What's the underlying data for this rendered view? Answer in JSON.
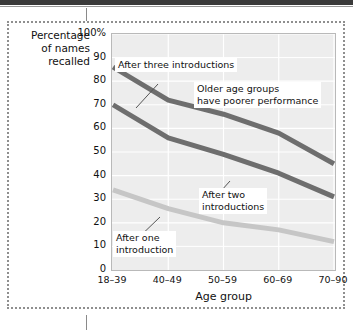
{
  "figure": {
    "y_axis_title": "Percentage\nof names\nrecalled",
    "x_axis_title": "Age group"
  },
  "annotations": {
    "three": "After three introductions",
    "older": "Older age groups\nhave poorer performance",
    "two": "After two\nintroductions",
    "one": "After one\nintroduction"
  },
  "colors": {
    "dark_line": "#6e6e6e",
    "light_line": "#c6c6c6",
    "plot_background": "#ededed",
    "gridline": "#ffffff",
    "frame": "#8f8f8f",
    "text": "#111111"
  },
  "chart_data": {
    "type": "line",
    "title": "",
    "xlabel": "Age group",
    "ylabel": "Percentage of names recalled",
    "categories": [
      "18–39",
      "40–49",
      "50–59",
      "60–69",
      "70–90"
    ],
    "ylim": [
      0,
      100
    ],
    "yticks": [
      "0",
      "10",
      "20",
      "30",
      "40",
      "50",
      "60",
      "70",
      "80",
      "90",
      "100%"
    ],
    "ytick_values": [
      0,
      10,
      20,
      30,
      40,
      50,
      60,
      70,
      80,
      90,
      100
    ],
    "grid": true,
    "legend": "annotations",
    "series": [
      {
        "name": "After three introductions",
        "color": "#6e6e6e",
        "values": [
          86,
          72,
          66,
          58,
          45
        ]
      },
      {
        "name": "After two introductions",
        "color": "#6e6e6e",
        "values": [
          70,
          56,
          49,
          41,
          31
        ]
      },
      {
        "name": "After one introduction",
        "color": "#c6c6c6",
        "values": [
          34,
          26,
          20,
          17,
          12
        ]
      }
    ],
    "annotations": [
      "After three introductions",
      "Older age groups have poorer performance",
      "After two introductions",
      "After one introduction"
    ]
  }
}
